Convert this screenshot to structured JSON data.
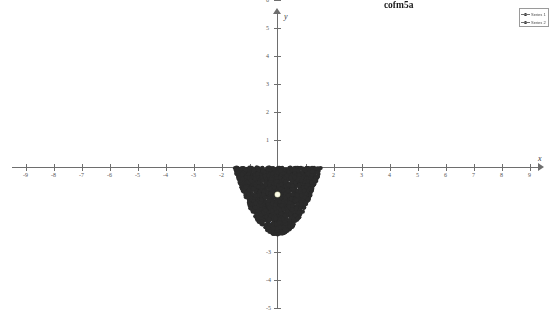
{
  "chart_data": {
    "type": "scatter",
    "title": "cofm5a",
    "xlabel": "x",
    "ylabel": "y",
    "grid": false,
    "legend_position": "top-right",
    "xlim": [
      -9.5,
      9.5
    ],
    "ylim": [
      -5.5,
      7.5
    ],
    "x_ticks": [
      -9,
      -8,
      -7,
      -6,
      -5,
      -4,
      -3,
      -2,
      -1,
      1,
      2,
      3,
      4,
      5,
      6,
      7,
      8,
      9
    ],
    "y_ticks": [
      -5,
      -4,
      -3,
      -2,
      -1,
      1,
      2,
      3,
      4,
      5,
      6,
      7
    ],
    "x_tick_labels": [
      "-9",
      "-8",
      "-7",
      "-6",
      "-5",
      "-4",
      "-3",
      "-2",
      "-1",
      "1",
      "2",
      "3",
      "4",
      "5",
      "6",
      "7",
      "8",
      "9"
    ],
    "y_tick_labels": [
      "-5",
      "-4",
      "-3",
      "-2",
      "-1",
      "1",
      "2",
      "3",
      "4",
      "5",
      "6",
      "7"
    ],
    "annotations": [
      {
        "text": "yellow dot is center of mass",
        "x": -7.7,
        "y": 6.35
      },
      {
        "text": "cofm5a",
        "x": 3.8,
        "y": 6.0
      }
    ],
    "series": [
      {
        "name": "Series 1",
        "label": "point-cloud",
        "marker": "filled-circle",
        "color": "#2b2b2b",
        "description": "dense cloud of points filling the region between the parabola y = x*x - 2.4 and y = 0, spanning x from about -2.0 to 2.0",
        "region": {
          "shape": "parabolic-segment",
          "x_min": -2.0,
          "x_max": 2.0,
          "y_min": -2.4,
          "y_max": 0.0,
          "curve": "y = x^2 - 2.4",
          "point_count": 2000
        }
      },
      {
        "name": "Series 2",
        "label": "center-of-mass",
        "marker": "filled-circle",
        "color": "#fdfde8",
        "points": [
          {
            "x": 0.0,
            "y": -0.96
          }
        ]
      }
    ],
    "legend_entries": [
      {
        "name": "Series 1",
        "color": "#2b2b2b"
      },
      {
        "name": "Series 2",
        "color": "#2b2b2b"
      }
    ]
  },
  "axes": {
    "x_name": "x",
    "y_name": "y"
  }
}
